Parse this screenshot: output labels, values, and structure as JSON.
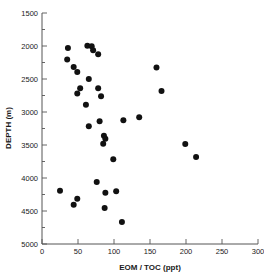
{
  "chart_data": {
    "type": "scatter",
    "title": "",
    "xlabel": "EOM / TOC (ppt)",
    "ylabel": "DEPTH (m)",
    "xlim": [
      0,
      300
    ],
    "ylim": [
      5000,
      1500
    ],
    "y_inverted": true,
    "grid": false,
    "legend": null,
    "xticks": [
      0,
      50,
      100,
      150,
      200,
      250,
      300
    ],
    "yticks": [
      1500,
      2000,
      2500,
      3000,
      3500,
      4000,
      4500,
      5000
    ],
    "xtick_labels": [
      "0",
      "50",
      "100",
      "150",
      "200",
      "250",
      "300"
    ],
    "ytick_labels": [
      "1500",
      "2000",
      "2500",
      "3000",
      "3500",
      "4000",
      "4500",
      "5000"
    ],
    "marker": "filled-circle",
    "marker_color": "#111111",
    "marker_size": 3,
    "points": [
      {
        "x": 36,
        "y": 2030
      },
      {
        "x": 35,
        "y": 2205
      },
      {
        "x": 63,
        "y": 1995
      },
      {
        "x": 69,
        "y": 2005
      },
      {
        "x": 71,
        "y": 2065
      },
      {
        "x": 78,
        "y": 2125
      },
      {
        "x": 44,
        "y": 2320
      },
      {
        "x": 49,
        "y": 2395
      },
      {
        "x": 65,
        "y": 2500
      },
      {
        "x": 53,
        "y": 2640
      },
      {
        "x": 49,
        "y": 2720
      },
      {
        "x": 78,
        "y": 2640
      },
      {
        "x": 82,
        "y": 2760
      },
      {
        "x": 61,
        "y": 2890
      },
      {
        "x": 65,
        "y": 3215
      },
      {
        "x": 80,
        "y": 3140
      },
      {
        "x": 113,
        "y": 3125
      },
      {
        "x": 135,
        "y": 3080
      },
      {
        "x": 86,
        "y": 3360
      },
      {
        "x": 88,
        "y": 3405
      },
      {
        "x": 85,
        "y": 3480
      },
      {
        "x": 99,
        "y": 3715
      },
      {
        "x": 159,
        "y": 2325
      },
      {
        "x": 166,
        "y": 2680
      },
      {
        "x": 199,
        "y": 3485
      },
      {
        "x": 214,
        "y": 3680
      },
      {
        "x": 76,
        "y": 4060
      },
      {
        "x": 25,
        "y": 4195
      },
      {
        "x": 49,
        "y": 4315
      },
      {
        "x": 44,
        "y": 4405
      },
      {
        "x": 88,
        "y": 4225
      },
      {
        "x": 103,
        "y": 4200
      },
      {
        "x": 87,
        "y": 4455
      },
      {
        "x": 111,
        "y": 4665
      }
    ]
  },
  "axes": {
    "x_axis_label": "EOM / TOC (ppt)",
    "y_axis_label": "DEPTH (m)"
  }
}
